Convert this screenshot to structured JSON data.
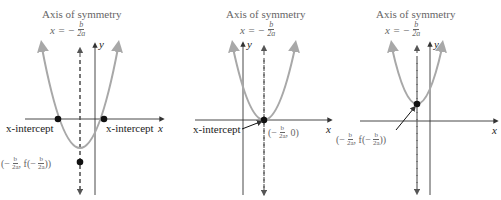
{
  "figure": {
    "colors": {
      "parabola": "#a8a8a8",
      "axis": "#333333",
      "symmetry_line": "#555555",
      "points": "#111111",
      "label_text": "#666666"
    },
    "panels": [
      {
        "title": "Axis of symmetry",
        "formula_lhs": "x = −",
        "formula_num": "b",
        "formula_den": "2a",
        "x_axis_label": "x",
        "y_axis_label": "y",
        "intercept_left_label": "x-intercept",
        "intercept_right_label": "x-intercept",
        "vertex_label_prefix": "(−",
        "vertex_label_mid": ", f(−",
        "vertex_label_suffix": "))",
        "vertex_num": "b",
        "vertex_den": "2a",
        "case": "two x-intercepts, vertex below x-axis"
      },
      {
        "title": "Axis of symmetry",
        "formula_lhs": "x = −",
        "formula_num": "b",
        "formula_den": "2a",
        "x_axis_label": "x",
        "y_axis_label": "y",
        "intercept_label": "x-intercept",
        "vertex_label_prefix": "(−",
        "vertex_label_suffix": ", 0)",
        "vertex_num": "b",
        "vertex_den": "2a",
        "case": "one x-intercept, vertex on x-axis"
      },
      {
        "title": "Axis of symmetry",
        "formula_lhs": "x = −",
        "formula_num": "b",
        "formula_den": "2a",
        "x_axis_label": "x",
        "y_axis_label": "y",
        "vertex_label_prefix": "(−",
        "vertex_label_mid": ", f(−",
        "vertex_label_suffix": "))",
        "vertex_num": "b",
        "vertex_den": "2a",
        "case": "no x-intercepts, vertex above x-axis"
      }
    ]
  }
}
